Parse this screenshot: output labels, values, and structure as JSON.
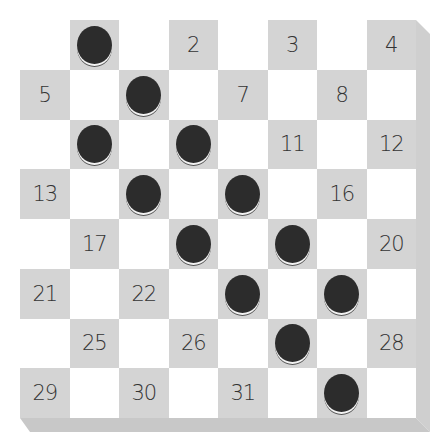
{
  "board": {
    "size": 8,
    "colors": {
      "dark_square": "#d4d4d4",
      "light_square": "#ffffff",
      "stone": "#2c2c2c"
    },
    "rows": [
      [
        {
          "t": ""
        },
        {
          "t": "",
          "stone": true
        },
        {
          "t": ""
        },
        {
          "t": "2"
        },
        {
          "t": ""
        },
        {
          "t": "3"
        },
        {
          "t": ""
        },
        {
          "t": "4"
        }
      ],
      [
        {
          "t": "5"
        },
        {
          "t": ""
        },
        {
          "t": "",
          "stone": true
        },
        {
          "t": ""
        },
        {
          "t": "7"
        },
        {
          "t": ""
        },
        {
          "t": "8"
        },
        {
          "t": ""
        }
      ],
      [
        {
          "t": ""
        },
        {
          "t": "",
          "stone": true
        },
        {
          "t": ""
        },
        {
          "t": "",
          "stone": true
        },
        {
          "t": ""
        },
        {
          "t": "11"
        },
        {
          "t": ""
        },
        {
          "t": "12"
        }
      ],
      [
        {
          "t": "13"
        },
        {
          "t": ""
        },
        {
          "t": "",
          "stone": true
        },
        {
          "t": ""
        },
        {
          "t": "",
          "stone": true
        },
        {
          "t": ""
        },
        {
          "t": "16"
        },
        {
          "t": ""
        }
      ],
      [
        {
          "t": ""
        },
        {
          "t": "17"
        },
        {
          "t": ""
        },
        {
          "t": "",
          "stone": true
        },
        {
          "t": ""
        },
        {
          "t": "",
          "stone": true
        },
        {
          "t": ""
        },
        {
          "t": "20"
        }
      ],
      [
        {
          "t": "21"
        },
        {
          "t": ""
        },
        {
          "t": "22"
        },
        {
          "t": ""
        },
        {
          "t": "",
          "stone": true
        },
        {
          "t": ""
        },
        {
          "t": "",
          "stone": true
        },
        {
          "t": ""
        }
      ],
      [
        {
          "t": ""
        },
        {
          "t": "25"
        },
        {
          "t": ""
        },
        {
          "t": "26"
        },
        {
          "t": ""
        },
        {
          "t": "",
          "stone": true
        },
        {
          "t": ""
        },
        {
          "t": "28"
        }
      ],
      [
        {
          "t": "29"
        },
        {
          "t": ""
        },
        {
          "t": "30"
        },
        {
          "t": ""
        },
        {
          "t": "31"
        },
        {
          "t": ""
        },
        {
          "t": "",
          "stone": true
        },
        {
          "t": ""
        }
      ]
    ]
  }
}
